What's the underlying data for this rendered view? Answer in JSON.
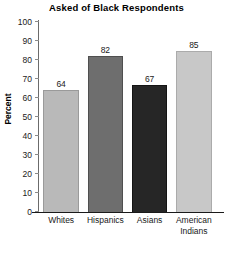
{
  "chart_data": {
    "type": "bar",
    "title": "Asked of Black Respondents",
    "xlabel": "",
    "ylabel": "Percent",
    "ylim": [
      0,
      100
    ],
    "yticks": [
      0,
      10,
      20,
      30,
      40,
      50,
      60,
      70,
      80,
      90,
      100
    ],
    "grid": false,
    "legend": null,
    "categories": [
      "Whites",
      "Hispanics",
      "Asians",
      "American Indians"
    ],
    "values": [
      64,
      82,
      67,
      85
    ],
    "value_labels": [
      "64",
      "82",
      "67",
      "85"
    ],
    "bar_colors": [
      "#b9b9b9",
      "#6e6e6e",
      "#262626",
      "#c8c8c8"
    ],
    "bar_edge_colors": [
      "#9a9a9a",
      "#4f4f4f",
      "#141414",
      "#ababab"
    ]
  }
}
